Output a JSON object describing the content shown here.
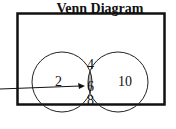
{
  "diagram": {
    "title": "Venn Diagram",
    "regions": {
      "left_only": "2",
      "intersection_top": "4",
      "intersection_middle": "6",
      "intersection_bottom": "8",
      "right_only": "10"
    },
    "colors": {
      "intersection_fill": "#b0b0b0",
      "stroke": "#111111"
    }
  }
}
